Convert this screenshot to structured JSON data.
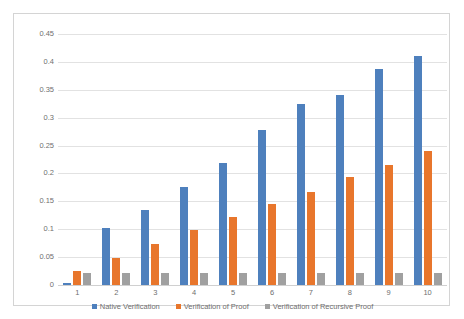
{
  "chart_data": {
    "type": "bar",
    "title": "",
    "xlabel": "",
    "ylabel": "",
    "categories": [
      "1",
      "2",
      "3",
      "4",
      "5",
      "6",
      "7",
      "8",
      "9",
      "10"
    ],
    "series": [
      {
        "name": "Native Verification",
        "color": "#4e80bd",
        "values": [
          0.003,
          0.103,
          0.134,
          0.176,
          0.218,
          0.278,
          0.324,
          0.341,
          0.388,
          0.411
        ]
      },
      {
        "name": "Verification of Proof",
        "color": "#e8762c",
        "values": [
          0.025,
          0.049,
          0.073,
          0.098,
          0.122,
          0.146,
          0.167,
          0.193,
          0.216,
          0.24
        ]
      },
      {
        "name": "Verification of Recursive Proof",
        "color": "#a0a0a0",
        "values": [
          0.022,
          0.022,
          0.022,
          0.022,
          0.022,
          0.022,
          0.022,
          0.022,
          0.022,
          0.022
        ]
      }
    ],
    "ylim": [
      0,
      0.45
    ],
    "yticks": [
      "0",
      "0.05",
      "0.1",
      "0.15",
      "0.2",
      "0.25",
      "0.3",
      "0.35",
      "0.4",
      "0.45"
    ],
    "ytick_values": [
      0,
      0.05,
      0.1,
      0.15,
      0.2,
      0.25,
      0.3,
      0.35,
      0.4,
      0.45
    ],
    "grid": true,
    "legend_position": "bottom"
  }
}
